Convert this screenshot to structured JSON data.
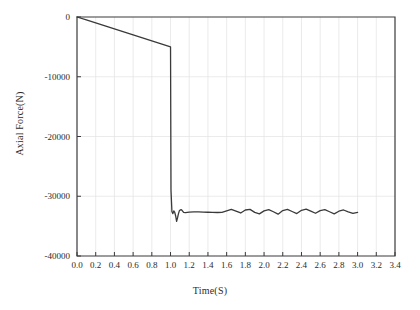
{
  "chart_data": {
    "type": "line",
    "title": "",
    "xlabel": "Time(S)",
    "ylabel": "Axial Force(N)",
    "xlim": [
      0.0,
      3.4
    ],
    "ylim": [
      -40000,
      0
    ],
    "grid": true,
    "legend": false,
    "xticks": [
      "0.0",
      "0.2",
      "0.4",
      "0.6",
      "0.8",
      "1.0",
      "1.2",
      "1.4",
      "1.6",
      "1.8",
      "2.0",
      "2.2",
      "2.4",
      "2.6",
      "2.8",
      "3.0",
      "3.2",
      "3.4"
    ],
    "xtick_values": [
      0.0,
      0.2,
      0.4,
      0.6,
      0.8,
      1.0,
      1.2,
      1.4,
      1.6,
      1.8,
      2.0,
      2.2,
      2.4,
      2.6,
      2.8,
      3.0,
      3.2,
      3.4
    ],
    "yticks": [
      "0",
      "-10000",
      "-20000",
      "-30000",
      "-40000"
    ],
    "ytick_values": [
      0,
      -10000,
      -20000,
      -30000,
      -40000
    ],
    "line_color": "#3a3a3a",
    "series": [
      {
        "name": "Axial Force",
        "x": [
          0.0,
          0.1,
          0.2,
          0.3,
          0.4,
          0.5,
          0.6,
          0.7,
          0.8,
          0.9,
          1.0,
          1.005,
          1.015,
          1.025,
          1.035,
          1.045,
          1.055,
          1.065,
          1.075,
          1.085,
          1.095,
          1.105,
          1.115,
          1.125,
          1.14,
          1.16,
          1.18,
          1.2,
          1.25,
          1.3,
          1.35,
          1.4,
          1.45,
          1.5,
          1.55,
          1.6,
          1.65,
          1.7,
          1.75,
          1.8,
          1.85,
          1.9,
          1.95,
          2.0,
          2.05,
          2.1,
          2.15,
          2.2,
          2.25,
          2.3,
          2.35,
          2.4,
          2.45,
          2.5,
          2.55,
          2.6,
          2.65,
          2.7,
          2.75,
          2.8,
          2.85,
          2.9,
          2.95,
          3.0
        ],
        "y": [
          0,
          -500,
          -1000,
          -1500,
          -2000,
          -2500,
          -3000,
          -3500,
          -4000,
          -4500,
          -5000,
          -29000,
          -32600,
          -32900,
          -32450,
          -32700,
          -33300,
          -34200,
          -33600,
          -32900,
          -32400,
          -32300,
          -32250,
          -32400,
          -32700,
          -32750,
          -32700,
          -32650,
          -32600,
          -32620,
          -32650,
          -32680,
          -32700,
          -32720,
          -32700,
          -32450,
          -32200,
          -32500,
          -32800,
          -32300,
          -32200,
          -32700,
          -32950,
          -32450,
          -32250,
          -32600,
          -33000,
          -32400,
          -32200,
          -32550,
          -32900,
          -32350,
          -32150,
          -32500,
          -32850,
          -32400,
          -32250,
          -32600,
          -32950,
          -32500,
          -32300,
          -32600,
          -32850,
          -32700
        ]
      }
    ]
  }
}
